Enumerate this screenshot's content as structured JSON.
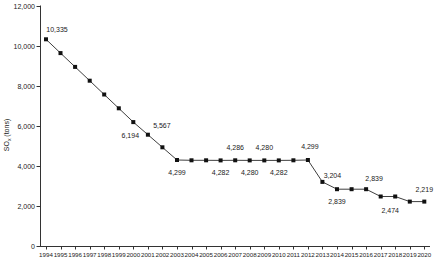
{
  "page": {
    "background": "#ffffff"
  },
  "chart_data": {
    "type": "line",
    "title": "",
    "xlabel": "",
    "ylabel": "SOx (tons)",
    "ylabel_rich": {
      "base": "SO",
      "sub": "x",
      "rest": " (tons)"
    },
    "x": [
      1994,
      1995,
      1996,
      1997,
      1998,
      1999,
      2000,
      2001,
      2002,
      2003,
      2004,
      2005,
      2006,
      2007,
      2008,
      2009,
      2010,
      2011,
      2012,
      2013,
      2014,
      2015,
      2016,
      2017,
      2018,
      2019,
      2020
    ],
    "values": [
      10335,
      9645,
      8955,
      8265,
      7575,
      6885,
      6194,
      5567,
      4933,
      4299,
      4285,
      4283,
      4282,
      4286,
      4280,
      4280,
      4282,
      4285,
      4299,
      3204,
      2839,
      2839,
      2839,
      2474,
      2474,
      2219,
      2219
    ],
    "ylim": [
      0,
      12000
    ],
    "ytick_step": 2000,
    "ytick_labels": [
      "0",
      "2,000",
      "4,000",
      "6,000",
      "8,000",
      "10,000",
      "12,000"
    ],
    "xtick_labels": [
      "1994",
      "1995",
      "1996",
      "1997",
      "1998",
      "1999",
      "2000",
      "2001",
      "2002",
      "2003",
      "2004",
      "2005",
      "2006",
      "2007",
      "2008",
      "2009",
      "2010",
      "2011",
      "2012",
      "2013",
      "2014",
      "2015",
      "2016",
      "2017",
      "2018",
      "2019",
      "2020"
    ],
    "grid": false,
    "legend_position": "none",
    "marker": "filled-square",
    "colors": {
      "line": "#3f3f3f",
      "marker": "#111111",
      "text": "#1a1a1a",
      "axis": "#333333"
    },
    "point_labels": [
      {
        "year": 1994,
        "text": "10,335",
        "dx": 11,
        "dy": -7
      },
      {
        "year": 2000,
        "text": "6,194",
        "dx": -3,
        "dy": 16
      },
      {
        "year": 2001,
        "text": "5,567",
        "dx": 14,
        "dy": -7
      },
      {
        "year": 2003,
        "text": "4,299",
        "dx": 0,
        "dy": 15
      },
      {
        "year": 2006,
        "text": "4,282",
        "dx": 0,
        "dy": 15
      },
      {
        "year": 2007,
        "text": "4,286",
        "dx": 0,
        "dy": -10
      },
      {
        "year": 2008,
        "text": "4,280",
        "dx": 0,
        "dy": 15
      },
      {
        "year": 2009,
        "text": "4,280",
        "dx": 0,
        "dy": -10
      },
      {
        "year": 2010,
        "text": "4,282",
        "dx": 0,
        "dy": 15
      },
      {
        "year": 2012,
        "text": "4,299",
        "dx": 2,
        "dy": -11
      },
      {
        "year": 2013,
        "text": "3,204",
        "dx": 10,
        "dy": -4
      },
      {
        "year": 2014,
        "text": "2,839",
        "dx": 0,
        "dy": 15
      },
      {
        "year": 2016,
        "text": "2,839",
        "dx": 8,
        "dy": -8
      },
      {
        "year": 2018,
        "text": "2,474",
        "dx": -5,
        "dy": 16
      },
      {
        "year": 2020,
        "text": "2,219",
        "dx": 0,
        "dy": -10
      }
    ]
  }
}
